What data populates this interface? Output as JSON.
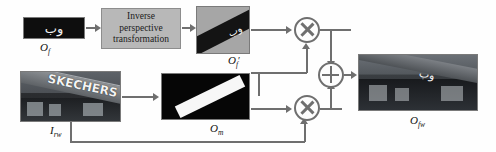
{
  "figure": {
    "type": "block-diagram"
  },
  "blocks": {
    "of": {
      "label": "O",
      "subscript": "f",
      "prime": "",
      "content_text": "وب",
      "description": "cropped rectified text region, white script on black"
    },
    "transform": {
      "line1": "Inverse",
      "line2": "perspective",
      "line3": "transformation",
      "box_color": "#b8b8b8"
    },
    "of_prime": {
      "label": "O",
      "subscript": "f",
      "prime": "′",
      "content_text": "وب",
      "description": "warped text band on grey background"
    },
    "irw": {
      "label": "I",
      "subscript": "rw",
      "prime": "",
      "sign_text": "SKECHERS",
      "description": "real-world storefront photograph"
    },
    "om": {
      "label": "O",
      "subscript": "m",
      "prime": "",
      "description": "binary mask, white quadrilateral on black"
    },
    "ofw": {
      "label": "O",
      "subscript": "fw",
      "prime": "",
      "content_text": "وب",
      "description": "final composited result image"
    }
  },
  "operators": {
    "mul_top": {
      "symbol": "×",
      "name": "multiply"
    },
    "mul_bottom": {
      "symbol": "×",
      "name": "multiply"
    },
    "add": {
      "symbol": "+",
      "name": "add"
    }
  },
  "colors": {
    "wire": "#6f6f6f",
    "process_box": "#b8b8b8",
    "mask_fg": "#f7f7f7",
    "mask_bg": "#060606",
    "background": "#ffffff"
  }
}
